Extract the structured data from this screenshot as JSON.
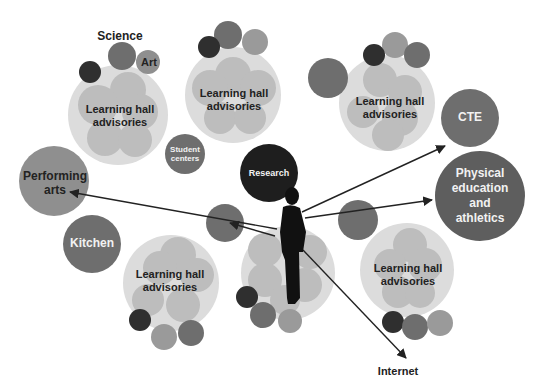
{
  "colors": {
    "hall_bg": "#dcdcdc",
    "pod_light": "#bdbdbd",
    "pod_mid": "#8f8f8f",
    "pod_dark": "#6e6e6e",
    "pod_darkest": "#2f2f2f",
    "arrow": "#222222",
    "person": "#111111"
  },
  "labels": {
    "science": "Science",
    "art": "Art",
    "student_centers_1": "Student",
    "student_centers_2": "centers",
    "research": "Research",
    "performing_arts_1": "Performing",
    "performing_arts_2": "arts",
    "kitchen": "Kitchen",
    "cte": "CTE",
    "pe_1": "Physical",
    "pe_2": "education",
    "pe_3": "and",
    "pe_4": "athletics",
    "internet": "Internet",
    "hall_1": "Learning hall",
    "hall_2": "advisories"
  },
  "learning_halls": [
    {
      "id": "top-left",
      "line1": "Learning hall",
      "line2": "advisories"
    },
    {
      "id": "top-center",
      "line1": "Learning hall",
      "line2": "advisories"
    },
    {
      "id": "top-right",
      "line1": "Learning hall",
      "line2": "advisories"
    },
    {
      "id": "bottom-left",
      "line1": "Learning hall",
      "line2": "advisories"
    },
    {
      "id": "bottom-right",
      "line1": "Learning hall",
      "line2": "advisories"
    }
  ]
}
